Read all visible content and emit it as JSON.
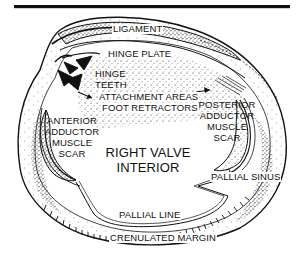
{
  "diagram": {
    "title_rule": true,
    "colors": {
      "ink": "#111111",
      "background": "#ffffff",
      "stipple": "#2a2a2a"
    },
    "labels": {
      "ligament": "LIGAMENT",
      "hinge_plate": "HINGE PLATE",
      "hinge_teeth_line1": "HINGE",
      "hinge_teeth_line2": "TEETH",
      "attachment_line1": "ATTACHMENT AREAS",
      "attachment_line2": "FOOT RETRACTORS",
      "posterior_line1": "POSTERIOR",
      "posterior_line2": "ADDUCTOR",
      "posterior_line3": "MUSCLE",
      "posterior_line4": "SCAR",
      "anterior_line1": "ANTERIOR",
      "anterior_line2": "ADDUCTOR",
      "anterior_line3": "MUSCLE",
      "anterior_line4": "SCAR",
      "center_line1": "RIGHT VALVE",
      "center_line2": "INTERIOR",
      "pallial_sinus": "PALLIAL SINUS",
      "pallial_line": "PALLIAL LINE",
      "crenulated_margin": "CRENULATED MARGIN"
    }
  }
}
